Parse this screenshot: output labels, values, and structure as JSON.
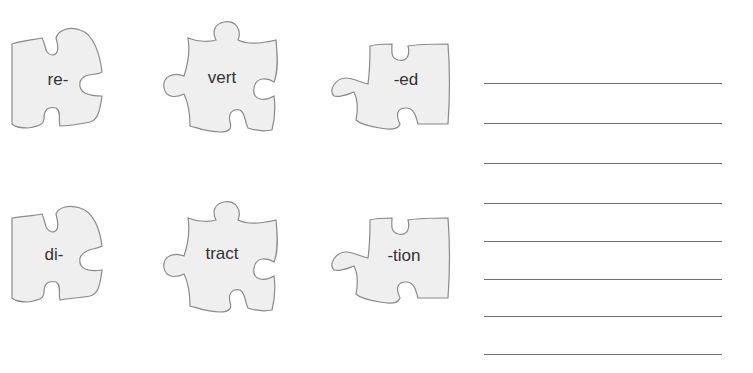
{
  "worksheet": {
    "colors": {
      "piece_fill": "#efefef",
      "piece_stroke": "#8a8a8a",
      "text": "#333333",
      "line": "#6f6f6f"
    },
    "pieces": [
      {
        "id": "re",
        "label": "re-",
        "type": "prefix"
      },
      {
        "id": "vert",
        "label": "vert",
        "type": "root"
      },
      {
        "id": "ed",
        "label": "-ed",
        "type": "suffix"
      },
      {
        "id": "di",
        "label": "di-",
        "type": "prefix"
      },
      {
        "id": "tract",
        "label": "tract",
        "type": "root"
      },
      {
        "id": "tion",
        "label": "-tion",
        "type": "suffix"
      }
    ],
    "answer_lines_count": 8
  }
}
